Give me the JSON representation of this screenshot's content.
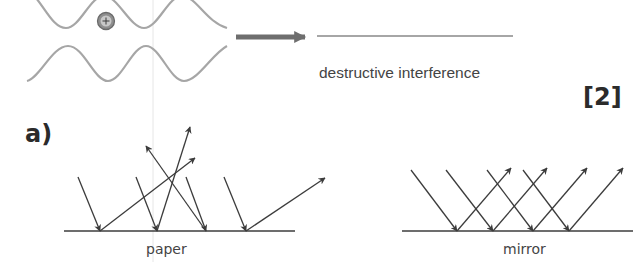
{
  "interference": {
    "result_caption": "destructive interference",
    "charge_symbol": "+",
    "wave_color": "#a6a6a6",
    "arrow_color": "#6e6e6e"
  },
  "marks": "[2]",
  "part_label": "a)",
  "diffuse": {
    "surface_label": "paper",
    "line_color": "#3c3c3c",
    "incident_rays": [
      {
        "from": [
          78,
          177
        ],
        "to": [
          100,
          231
        ]
      },
      {
        "from": [
          136,
          177
        ],
        "to": [
          157,
          231
        ]
      },
      {
        "from": [
          186,
          177
        ],
        "to": [
          206,
          231
        ]
      },
      {
        "from": [
          224,
          177
        ],
        "to": [
          246,
          231
        ]
      }
    ],
    "reflected_rays": [
      {
        "from": [
          100,
          231
        ],
        "to": [
          195,
          158
        ]
      },
      {
        "from": [
          157,
          231
        ],
        "to": [
          190,
          127
        ]
      },
      {
        "from": [
          206,
          231
        ],
        "to": [
          146,
          146
        ]
      },
      {
        "from": [
          246,
          231
        ],
        "to": [
          325,
          178
        ]
      }
    ]
  },
  "specular": {
    "surface_label": "mirror",
    "line_color": "#3c3c3c",
    "incident_rays": [
      {
        "from": [
          411,
          170
        ],
        "to": [
          457,
          231
        ]
      },
      {
        "from": [
          446,
          170
        ],
        "to": [
          493,
          231
        ]
      },
      {
        "from": [
          487,
          170
        ],
        "to": [
          533,
          231
        ]
      },
      {
        "from": [
          523,
          170
        ],
        "to": [
          569,
          231
        ]
      }
    ],
    "reflected_rays": [
      {
        "from": [
          457,
          231
        ],
        "to": [
          511,
          168
        ]
      },
      {
        "from": [
          493,
          231
        ],
        "to": [
          547,
          168
        ]
      },
      {
        "from": [
          533,
          231
        ],
        "to": [
          587,
          168
        ]
      },
      {
        "from": [
          569,
          231
        ],
        "to": [
          623,
          168
        ]
      }
    ]
  }
}
